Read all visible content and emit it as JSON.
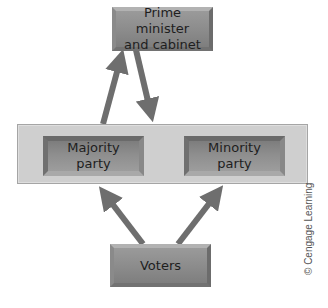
{
  "diagram": {
    "nodes": {
      "executive": {
        "line1": "Prime minister",
        "line2": "and cabinet"
      },
      "majority": {
        "line1": "Majority",
        "line2": "party"
      },
      "minority": {
        "line1": "Minority",
        "line2": "party"
      },
      "voters": {
        "label": "Voters"
      }
    },
    "group": {
      "name": "Parliament (parties panel)"
    },
    "edges": [
      {
        "from": "majority",
        "to": "executive"
      },
      {
        "from": "executive",
        "to": "parliament-panel"
      },
      {
        "from": "voters",
        "to": "majority"
      },
      {
        "from": "voters",
        "to": "minority"
      }
    ],
    "colors": {
      "arrow": "#6e6e6e",
      "box": "#8f8f8f",
      "panel": "#cfcfcf",
      "text": "#1e1e1e"
    }
  },
  "credit": "© Cengage Learning"
}
